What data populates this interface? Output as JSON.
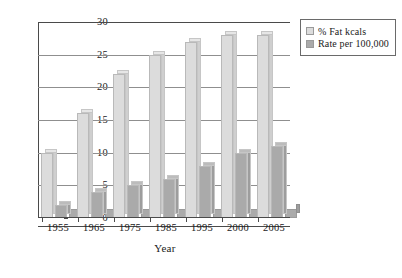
{
  "chart_data": {
    "type": "bar",
    "title": "",
    "xlabel": "Year",
    "ylabel": "",
    "categories": [
      "1955",
      "1965",
      "1975",
      "1985",
      "1995",
      "2000",
      "2005"
    ],
    "series": [
      {
        "name": "% Fat kcals",
        "values": [
          10,
          16,
          22,
          25,
          27,
          28,
          28
        ],
        "color": "#dcdcdc"
      },
      {
        "name": "Rate per 100,000",
        "values": [
          2,
          4,
          5,
          6,
          8,
          10,
          11
        ],
        "color": "#aaaaaa"
      }
    ],
    "ylim": [
      0,
      30
    ],
    "yticks": [
      "0",
      "5",
      "10",
      "15",
      "20",
      "25",
      "30"
    ],
    "grid": "horizontal",
    "legend_position": "top-right",
    "style": "3d-clustered-column"
  },
  "legend": {
    "items": [
      {
        "label": "% Fat kcals",
        "swatch": "light-gray-swatch"
      },
      {
        "label": "Rate per 100,000",
        "swatch": "medium-gray-swatch"
      }
    ]
  },
  "axis": {
    "x_title": "Year"
  }
}
